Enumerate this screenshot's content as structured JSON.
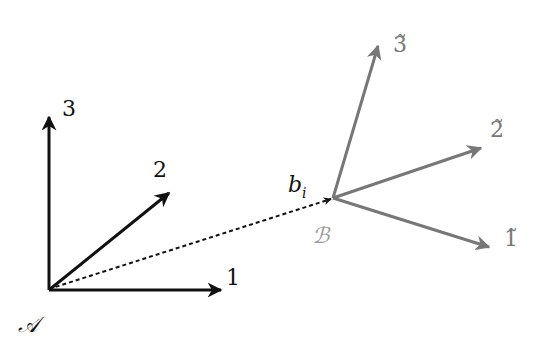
{
  "diagram": {
    "colors": {
      "frame_a": "#111111",
      "frame_b": "#777777",
      "connector": "#111111",
      "background": "#ffffff"
    },
    "frame_a": {
      "origin_label": "𝒜",
      "origin": [
        49,
        289
      ],
      "axes": [
        {
          "label": "1",
          "end": [
            222,
            290
          ],
          "label_pos": [
            226,
            285
          ]
        },
        {
          "label": "2",
          "end": [
            170,
            192
          ],
          "label_pos": [
            153,
            177
          ]
        },
        {
          "label": "3",
          "end": [
            49,
            116
          ],
          "label_pos": [
            62,
            116
          ]
        }
      ]
    },
    "frame_b": {
      "origin_label": "ℬ",
      "origin": [
        333,
        198
      ],
      "axes": [
        {
          "label": "1̃",
          "end": [
            490,
            247
          ],
          "label_pos": [
            504,
            246
          ]
        },
        {
          "label": "2̃",
          "end": [
            482,
            148
          ],
          "label_pos": [
            490,
            137
          ]
        },
        {
          "label": "3̃",
          "end": [
            379,
            45
          ],
          "label_pos": [
            393,
            52
          ]
        }
      ]
    },
    "connector": {
      "label": "b",
      "label_subscript": "i",
      "from": [
        49,
        289
      ],
      "to": [
        333,
        198
      ],
      "style": "dotted"
    }
  }
}
